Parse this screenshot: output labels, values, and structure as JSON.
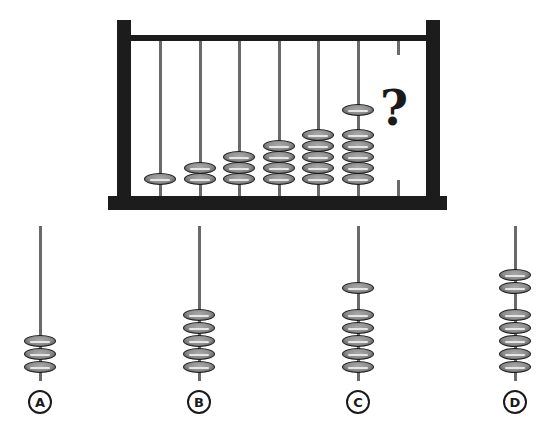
{
  "puzzle": {
    "question_mark": "?",
    "abacus_rods": [
      {
        "bead_groups": [
          1
        ]
      },
      {
        "bead_groups": [
          2
        ]
      },
      {
        "bead_groups": [
          3
        ]
      },
      {
        "bead_groups": [
          4
        ]
      },
      {
        "bead_groups": [
          5
        ]
      },
      {
        "bead_groups": [
          5,
          1
        ]
      },
      {
        "bead_groups": null,
        "missing": true
      }
    ]
  },
  "options": [
    {
      "label": "A",
      "bead_groups": [
        3
      ]
    },
    {
      "label": "B",
      "bead_groups": [
        5
      ]
    },
    {
      "label": "C",
      "bead_groups": [
        5,
        1
      ]
    },
    {
      "label": "D",
      "bead_groups": [
        5,
        2
      ]
    }
  ],
  "colors": {
    "frame": "#1c1c1c",
    "rod": "#6a6a6a",
    "bead": "#8c8c8c",
    "bead_highlight": "#e6e6e6"
  }
}
